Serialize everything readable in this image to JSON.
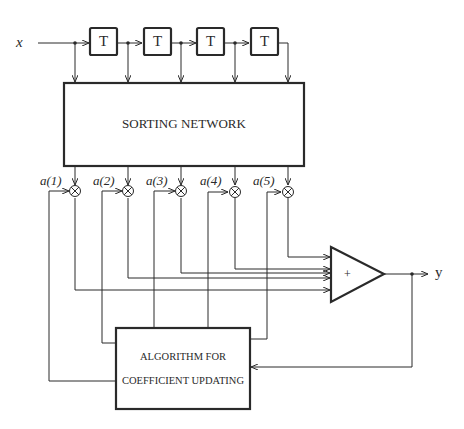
{
  "diagram": {
    "type": "block-diagram",
    "input_label": "x",
    "output_label": "y",
    "delay_blocks": [
      {
        "id": "T1",
        "label": "T"
      },
      {
        "id": "T2",
        "label": "T"
      },
      {
        "id": "T3",
        "label": "T"
      },
      {
        "id": "T4",
        "label": "T"
      }
    ],
    "sorting_network": {
      "label": "SORTING NETWORK"
    },
    "coefficients": [
      {
        "label": "a(1)"
      },
      {
        "label": "a(2)"
      },
      {
        "label": "a(3)"
      },
      {
        "label": "a(4)"
      },
      {
        "label": "a(5)"
      }
    ],
    "multiplier_symbol": "⊗",
    "summer": {
      "label": "+"
    },
    "update_block": {
      "line1": "ALGORITHM FOR",
      "line2": "COEFFICIENT UPDATING"
    },
    "colors": {
      "stroke": "#2a2a2a",
      "background": "#ffffff"
    }
  }
}
